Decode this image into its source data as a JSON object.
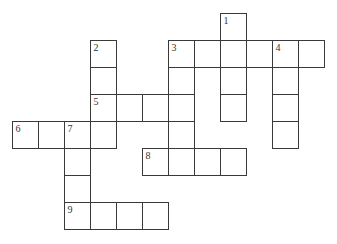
{
  "puzzle": {
    "type": "crossword",
    "grid": {
      "origin_x": 12,
      "origin_y": 13,
      "cell_width": 26,
      "cell_height": 27,
      "border_color": "#3a3a3a",
      "background": "#ffffff"
    },
    "entries": [
      {
        "number": "1",
        "direction": "down",
        "col": 8,
        "row": 0,
        "length": 4
      },
      {
        "number": "2",
        "direction": "down",
        "col": 3,
        "row": 1,
        "length": 4
      },
      {
        "number": "3",
        "direction": "across",
        "col": 6,
        "row": 1,
        "length": 6
      },
      {
        "number": "3",
        "direction": "down",
        "col": 6,
        "row": 1,
        "length": 5
      },
      {
        "number": "4",
        "direction": "down",
        "col": 10,
        "row": 1,
        "length": 4
      },
      {
        "number": "5",
        "direction": "across",
        "col": 3,
        "row": 3,
        "length": 4
      },
      {
        "number": "6",
        "direction": "across",
        "col": 0,
        "row": 4,
        "length": 4
      },
      {
        "number": "7",
        "direction": "down",
        "col": 2,
        "row": 4,
        "length": 4
      },
      {
        "number": "8",
        "direction": "across",
        "col": 5,
        "row": 5,
        "length": 4
      },
      {
        "number": "9",
        "direction": "across",
        "col": 2,
        "row": 7,
        "length": 4
      }
    ]
  }
}
